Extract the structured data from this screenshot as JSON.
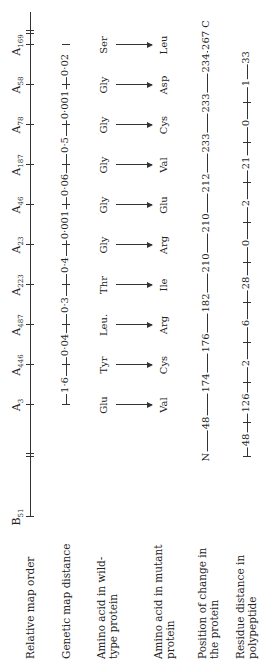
{
  "row_labels": {
    "map_order": "Relative map order",
    "map_distance": "Genetic map distance",
    "wild_type": "Amino acid in wild-type protein",
    "mutant": "Amino acid in mutant protein",
    "position": "Position of change in the protein",
    "residue_distance": "Residue distance in polypeptide"
  },
  "map_order": {
    "start": "B",
    "start_sub": "51",
    "markers": [
      {
        "label": "A",
        "sub": "3"
      },
      {
        "label": "A",
        "sub": "446"
      },
      {
        "label": "A",
        "sub": "487"
      },
      {
        "label": "A",
        "sub": "223"
      },
      {
        "label": "A",
        "sub": "23"
      },
      {
        "label": "A",
        "sub": "46"
      },
      {
        "label": "A",
        "sub": "187"
      },
      {
        "label": "A",
        "sub": "78"
      },
      {
        "label": "A",
        "sub": "58"
      },
      {
        "label": "A",
        "sub": "169"
      }
    ]
  },
  "map_distances": [
    "1·6",
    "0·04",
    "0·3",
    "0·4",
    "0·001",
    "0·06",
    "0·5",
    "0·001",
    "0·02"
  ],
  "wild_type": [
    "Glu",
    "Tyr",
    "Leu.",
    "Thr",
    "Gly",
    "Gly",
    "Gly",
    "Gly",
    "Gly",
    "Ser"
  ],
  "mutant": [
    "Val",
    "Cys",
    "Arg",
    "Ile",
    "Arg",
    "Glu",
    "Val",
    "Cys",
    "Asp",
    "Leu"
  ],
  "positions": {
    "start": "N",
    "values": [
      "48",
      "174",
      "176",
      "182",
      "210",
      "210",
      "212",
      "233",
      "233",
      "234"
    ],
    "end": "267 C"
  },
  "residue_distances": [
    "48",
    "126",
    "2",
    "6",
    "28",
    "0",
    "2",
    "21",
    "0",
    "1",
    "33"
  ]
}
